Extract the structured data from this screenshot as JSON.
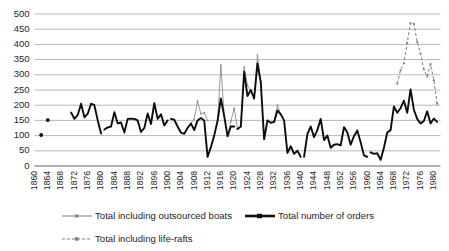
{
  "chart_data": {
    "type": "line",
    "title": "",
    "xlabel": "",
    "ylabel": "",
    "ylim": [
      0,
      500
    ],
    "ytick_step": 50,
    "yticks": [
      0,
      50,
      100,
      150,
      200,
      250,
      300,
      350,
      400,
      450,
      500
    ],
    "xlim": [
      1860,
      1982
    ],
    "xticks": [
      1860,
      1864,
      1868,
      1872,
      1876,
      1880,
      1884,
      1888,
      1892,
      1896,
      1900,
      1904,
      1908,
      1912,
      1916,
      1920,
      1924,
      1928,
      1932,
      1936,
      1940,
      1944,
      1948,
      1952,
      1956,
      1960,
      1964,
      1968,
      1972,
      1976,
      1980
    ],
    "grid": true,
    "grid_axis": "y",
    "legend_position": "bottom",
    "legend": [
      {
        "name": "Total including outsourced boats",
        "style": "thin-grey-line-with-markers",
        "color": "#8c8c8c"
      },
      {
        "name": "Total number of orders",
        "style": "thick-black-line",
        "color": "#0d0d0d"
      },
      {
        "name": "Total including life-rafts",
        "style": "dashed-grey-line-with-markers",
        "color": "#808080"
      }
    ],
    "series": [
      {
        "name": "Total number of orders",
        "color": "#0d0d0d",
        "segments": [
          {
            "x": [
              1862
            ],
            "values": [
              102
            ]
          },
          {
            "x": [
              1864
            ],
            "values": [
              151
            ]
          },
          {
            "x": [
              1871,
              1872,
              1873,
              1874,
              1875,
              1876,
              1877,
              1878,
              1879,
              1880
            ],
            "values": [
              176,
              155,
              168,
              205,
              160,
              172,
              205,
              200,
              150,
              107
            ]
          },
          {
            "x": [
              1881,
              1882,
              1883,
              1884,
              1885,
              1886,
              1887,
              1888,
              1889,
              1890,
              1891,
              1892,
              1893,
              1894,
              1895,
              1896,
              1897,
              1898,
              1899,
              1900
            ],
            "values": [
              120,
              127,
              130,
              177,
              140,
              143,
              110,
              155,
              156,
              155,
              150,
              112,
              125,
              173,
              138,
              207,
              155,
              170,
              133,
              150
            ]
          },
          {
            "x": [
              1901,
              1902,
              1903,
              1904,
              1905,
              1906,
              1907,
              1908,
              1909,
              1910,
              1911,
              1912,
              1913,
              1914,
              1915,
              1916,
              1917,
              1918,
              1919,
              1920
            ],
            "values": [
              155,
              152,
              130,
              110,
              106,
              125,
              140,
              118,
              150,
              158,
              150,
              30,
              62,
              100,
              148,
              222,
              165,
              98,
              130,
              130
            ]
          },
          {
            "x": [
              1921,
              1922,
              1923,
              1924,
              1925,
              1926,
              1927,
              1928,
              1929,
              1930,
              1931,
              1932,
              1933,
              1934,
              1935,
              1936,
              1937,
              1938,
              1939,
              1940
            ],
            "values": [
              122,
              130,
              310,
              230,
              250,
              222,
              337,
              275,
              88,
              150,
              142,
              145,
              183,
              170,
              150,
              43,
              65,
              40,
              50,
              30
            ]
          },
          {
            "x": [
              1941,
              1942,
              1943,
              1944,
              1945,
              1946,
              1947,
              1948,
              1949,
              1950,
              1951,
              1952,
              1953,
              1954,
              1955,
              1956,
              1957,
              1958,
              1959,
              1960
            ],
            "values": [
              30,
              105,
              130,
              95,
              118,
              155,
              85,
              100,
              60,
              70,
              72,
              68,
              128,
              110,
              70,
              98,
              117,
              78,
              35,
              30
            ]
          },
          {
            "x": [
              1961,
              1962,
              1963,
              1964,
              1965,
              1966,
              1967,
              1968,
              1969,
              1970,
              1971,
              1972,
              1973,
              1974,
              1975,
              1976,
              1977,
              1978,
              1979,
              1980,
              1981
            ],
            "values": [
              45,
              40,
              42,
              20,
              60,
              110,
              118,
              196,
              175,
              190,
              215,
              175,
              252,
              185,
              155,
              140,
              148,
              180,
              140,
              156,
              145
            ]
          }
        ]
      },
      {
        "name": "Total including outsourced boats",
        "color": "#8c8c8c",
        "segments": [
          {
            "x": [
              1907,
              1908,
              1909,
              1910,
              1911,
              1912
            ],
            "values": [
              140,
              155,
              213,
              172,
              175,
              150
            ]
          },
          {
            "x": [
              1915,
              1916,
              1917
            ],
            "values": [
              148,
              332,
              165
            ]
          },
          {
            "x": [
              1918,
              1919,
              1920,
              1921
            ],
            "values": [
              98,
              147,
              190,
              122
            ]
          },
          {
            "x": [
              1922,
              1923,
              1924,
              1925,
              1926,
              1927,
              1928
            ],
            "values": [
              130,
              325,
              265,
              250,
              222,
              365,
              275
            ]
          },
          {
            "x": [
              1932,
              1933,
              1934
            ],
            "values": [
              145,
              200,
              170
            ]
          }
        ]
      },
      {
        "name": "Total including life-rafts",
        "color": "#808080",
        "segments": [
          {
            "x": [
              1969,
              1970,
              1971,
              1972,
              1973,
              1974,
              1975,
              1976,
              1977,
              1978,
              1979,
              1980,
              1981
            ],
            "values": [
              271,
              315,
              338,
              405,
              470,
              468,
              408,
              370,
              318,
              295,
              335,
              282,
              205
            ]
          }
        ]
      }
    ]
  },
  "legend_labels": {
    "outsourced": "Total including outsourced boats",
    "orders": "Total number of orders",
    "rafts": "Total including life-rafts"
  }
}
